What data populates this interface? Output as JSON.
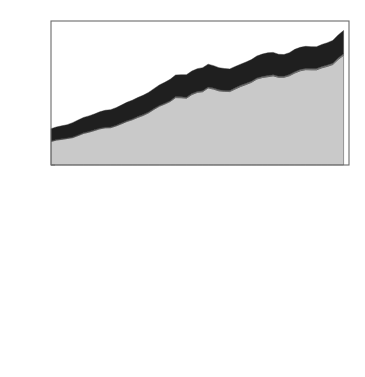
{
  "figure": {
    "y_axis_label": "Flux [PgC/y]",
    "y_ticks": [
      "0",
      "1",
      "2",
      "3",
      "4",
      "5",
      "6",
      "7",
      "8",
      "9",
      "10"
    ],
    "x_ticks": [
      "1950",
      "1955",
      "1960",
      "1965",
      "1970",
      "1975",
      "1980",
      "1985",
      "1990",
      "1995",
      "2000",
      "2005"
    ],
    "colors": {
      "dark": "#1f1f1f",
      "mid": "#8a8a8a",
      "light": "#c9c9c9",
      "frame": "#6b6b6b",
      "background": "#ffffff"
    }
  },
  "chart_data": [
    {
      "type": "area",
      "stacked": true,
      "title": "CO2 sources",
      "title_rich": {
        "pre": "CO",
        "sub": "2",
        "post": " sources"
      },
      "xlabel": "",
      "ylabel": "Flux [PgC/y]",
      "xlim": [
        1950,
        2005
      ],
      "ylim": [
        0,
        10
      ],
      "grid": false,
      "legend_position": "top-left-inside",
      "x": [
        1950,
        1951,
        1952,
        1953,
        1954,
        1955,
        1956,
        1957,
        1958,
        1959,
        1960,
        1961,
        1962,
        1963,
        1964,
        1965,
        1966,
        1967,
        1968,
        1969,
        1970,
        1971,
        1972,
        1973,
        1974,
        1975,
        1976,
        1977,
        1978,
        1979,
        1980,
        1981,
        1982,
        1983,
        1984,
        1985,
        1986,
        1987,
        1988,
        1989,
        1990,
        1991,
        1992,
        1993,
        1994,
        1995,
        1996,
        1997,
        1998,
        1999,
        2000,
        2001,
        2002,
        2003,
        2004
      ],
      "series": [
        {
          "name": "fossil fuel emissions",
          "color": "#c9c9c9",
          "values": [
            1.63,
            1.73,
            1.78,
            1.84,
            1.9,
            2.04,
            2.19,
            2.28,
            2.39,
            2.51,
            2.58,
            2.59,
            2.71,
            2.86,
            3.02,
            3.14,
            3.3,
            3.44,
            3.62,
            3.86,
            4.08,
            4.23,
            4.41,
            4.68,
            4.67,
            4.64,
            4.89,
            5.04,
            5.09,
            5.35,
            5.27,
            5.15,
            5.11,
            5.1,
            5.28,
            5.45,
            5.59,
            5.74,
            5.97,
            6.07,
            6.13,
            6.19,
            6.09,
            6.09,
            6.2,
            6.39,
            6.54,
            6.62,
            6.61,
            6.61,
            6.75,
            6.85,
            6.98,
            7.33,
            7.62
          ],
          "unit": "PgC/y"
        },
        {
          "name": "other sources",
          "color": "#8a8a8a",
          "values": [
            0.04,
            0.04,
            0.04,
            0.04,
            0.04,
            0.05,
            0.05,
            0.05,
            0.05,
            0.05,
            0.05,
            0.05,
            0.05,
            0.05,
            0.05,
            0.06,
            0.06,
            0.06,
            0.06,
            0.06,
            0.06,
            0.06,
            0.06,
            0.07,
            0.07,
            0.07,
            0.07,
            0.07,
            0.07,
            0.07,
            0.07,
            0.07,
            0.07,
            0.07,
            0.08,
            0.08,
            0.08,
            0.08,
            0.08,
            0.08,
            0.08,
            0.08,
            0.08,
            0.08,
            0.08,
            0.09,
            0.09,
            0.09,
            0.09,
            0.09,
            0.09,
            0.09,
            0.09,
            0.1,
            0.1
          ],
          "unit": "PgC/y"
        },
        {
          "name": "land use change",
          "color": "#1f1f1f",
          "values": [
            0.85,
            0.87,
            0.9,
            0.92,
            1.0,
            1.03,
            1.06,
            1.08,
            1.1,
            1.13,
            1.17,
            1.2,
            1.22,
            1.25,
            1.28,
            1.3,
            1.32,
            1.34,
            1.36,
            1.38,
            1.42,
            1.45,
            1.48,
            1.5,
            1.53,
            1.56,
            1.56,
            1.58,
            1.6,
            1.58,
            1.56,
            1.54,
            1.52,
            1.5,
            1.48,
            1.47,
            1.48,
            1.5,
            1.52,
            1.55,
            1.58,
            1.55,
            1.52,
            1.5,
            1.52,
            1.55,
            1.54,
            1.53,
            1.52,
            1.51,
            1.53,
            1.55,
            1.58,
            1.6,
            1.62
          ],
          "unit": "PgC/y"
        }
      ],
      "legend": [
        {
          "label": "land use change",
          "color": "#1f1f1f"
        },
        {
          "label": "other sources",
          "color": "#8a8a8a"
        },
        {
          "label": "fossil fuel emissions",
          "color": "#c9c9c9"
        }
      ]
    },
    {
      "type": "area",
      "stacked": true,
      "title": "CO2 sinks and accumulation",
      "title_rich": {
        "pre": "CO",
        "sub": "2",
        "post": " sinks and accumulation"
      },
      "xlabel": "",
      "ylabel": "Flux [PgC/y]",
      "xlim": [
        1950,
        2005
      ],
      "ylim": [
        0,
        10
      ],
      "grid": false,
      "legend_position": "top-left-inside",
      "x": [
        1950,
        1951,
        1952,
        1953,
        1954,
        1955,
        1956,
        1957,
        1958,
        1959,
        1960,
        1961,
        1962,
        1963,
        1964,
        1965,
        1966,
        1967,
        1968,
        1969,
        1970,
        1971,
        1972,
        1973,
        1974,
        1975,
        1976,
        1977,
        1978,
        1979,
        1980,
        1981,
        1982,
        1983,
        1984,
        1985,
        1986,
        1987,
        1988,
        1989,
        1990,
        1991,
        1992,
        1993,
        1994,
        1995,
        1996,
        1997,
        1998,
        1999,
        2000,
        2001,
        2002,
        2003,
        2004
      ],
      "series": [
        {
          "name": "ocean sink",
          "color": "#1f1f1f",
          "values": [
            0.88,
            0.9,
            0.92,
            0.95,
            0.97,
            1.0,
            1.03,
            1.05,
            1.08,
            1.1,
            1.14,
            1.12,
            1.24,
            1.3,
            1.36,
            1.42,
            1.5,
            1.55,
            1.6,
            1.62,
            1.7,
            1.76,
            1.74,
            1.82,
            1.88,
            1.86,
            1.9,
            1.94,
            1.98,
            2.02,
            2.06,
            2.04,
            2.08,
            2.0,
            2.06,
            2.12,
            2.16,
            2.14,
            2.2,
            2.18,
            2.24,
            2.22,
            2.2,
            2.18,
            2.26,
            2.3,
            2.34,
            2.32,
            2.3,
            2.34,
            2.38,
            2.36,
            2.4,
            2.44,
            2.48
          ],
          "unit": "PgC/y"
        },
        {
          "name": "terrestrial sink",
          "color": "#8a8a8a",
          "values": [
            0.82,
            0.95,
            1.0,
            1.0,
            1.05,
            1.03,
            0.98,
            1.0,
            1.05,
            1.1,
            1.3,
            0.62,
            0.7,
            0.62,
            0.58,
            0.78,
            1.6,
            1.05,
            0.62,
            0.42,
            1.4,
            2.05,
            0.38,
            0.55,
            1.85,
            1.45,
            0.75,
            0.55,
            1.1,
            0.88,
            0.35,
            1.08,
            3.05,
            0.55,
            1.3,
            1.85,
            1.55,
            0.42,
            0.95,
            1.45,
            2.05,
            2.75,
            4.0,
            2.7,
            1.0,
            1.75,
            2.6,
            0.3,
            1.05,
            2.3,
            3.1,
            1.6,
            1.1,
            2.1,
            2.7
          ],
          "unit": "PgC/y"
        },
        {
          "name": "atmospheric accumulation",
          "color": "#c9c9c9",
          "values": [
            0.95,
            0.9,
            0.92,
            1.0,
            1.05,
            1.1,
            1.35,
            1.4,
            1.42,
            1.5,
            1.25,
            2.0,
            1.9,
            2.05,
            2.2,
            2.1,
            1.45,
            2.05,
            2.55,
            2.95,
            2.1,
            1.6,
            3.35,
            3.2,
            2.0,
            2.5,
            3.3,
            3.6,
            3.1,
            3.45,
            4.1,
            3.5,
            1.45,
            4.1,
            3.4,
            3.0,
            3.4,
            4.55,
            4.2,
            3.8,
            3.3,
            2.7,
            1.55,
            2.9,
            4.6,
            4.0,
            3.1,
            5.4,
            4.7,
            3.5,
            2.8,
            4.4,
            5.0,
            4.3,
            4.2
          ],
          "unit": "PgC/y"
        }
      ],
      "legend": [
        {
          "label": "atmospheric accumulation",
          "color": "#c9c9c9"
        },
        {
          "label": "terrestrial sink",
          "color": "#8a8a8a"
        },
        {
          "label": "ocean sink",
          "color": "#1f1f1f"
        }
      ]
    }
  ]
}
